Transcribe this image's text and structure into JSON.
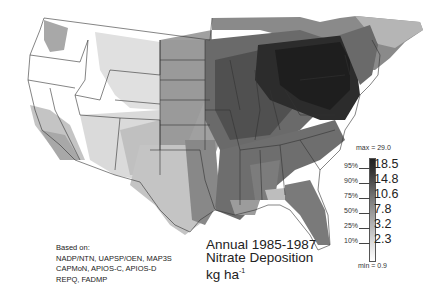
{
  "map": {
    "title_line1": "Annual 1985-1987",
    "title_line2": "Nitrate Deposition",
    "units_base": "kg ha",
    "units_exp": "-1",
    "sources": {
      "heading": "Based on:",
      "lines": [
        "NADP/NTN, UAPSP/OEN, MAP3S",
        "CAPMoN, APIOS-C, APIOS-D",
        "REPQ, FADMP"
      ]
    }
  },
  "legend": {
    "max_label": "max = 29.0",
    "min_label": "min = 0.9",
    "rows": [
      {
        "percentile": "95%",
        "value": "18.5"
      },
      {
        "percentile": "90%",
        "value": "14.8"
      },
      {
        "percentile": "75%",
        "value": "10.6"
      },
      {
        "percentile": "50%",
        "value": "7.8"
      },
      {
        "percentile": "25%",
        "value": "3.2"
      },
      {
        "percentile": "10%",
        "value": "2.3"
      }
    ],
    "colors": [
      "#222222",
      "#444444",
      "#5e5e5e",
      "#7a7a7a",
      "#9c9c9c",
      "#bdbdbd",
      "#dcdcdc",
      "#ffffff"
    ]
  }
}
